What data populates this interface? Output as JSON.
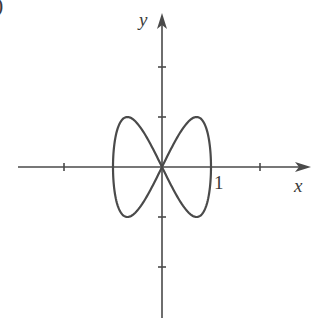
{
  "figure": {
    "panel_label_fragment": ")",
    "x_axis_label": "x",
    "y_axis_label": "y",
    "unit_tick_label": "1"
  },
  "colors": {
    "ink": "#4a4a4a",
    "background": "#ffffff"
  },
  "chart_data": {
    "type": "line",
    "title": "",
    "xlabel": "x",
    "ylabel": "y",
    "parametric": {
      "x": "cos(t)",
      "y": "sin(2t)",
      "t_range": [
        0,
        6.2832
      ]
    },
    "xlim": [
      -3,
      3
    ],
    "ylim": [
      -3,
      3
    ],
    "x_ticks": [
      -2,
      -1,
      1,
      2
    ],
    "y_ticks": [
      -2,
      -1,
      1,
      2
    ],
    "labeled_ticks": [
      {
        "axis": "x",
        "value": 1,
        "label": "1"
      }
    ],
    "grid": false,
    "legend": null,
    "series": [
      {
        "name": "curve",
        "points": [
          [
            1,
            0
          ],
          [
            0.924,
            0.707
          ],
          [
            0.707,
            1
          ],
          [
            0.383,
            0.707
          ],
          [
            0,
            0
          ],
          [
            -0.383,
            -0.707
          ],
          [
            -0.707,
            -1
          ],
          [
            -0.924,
            -0.707
          ],
          [
            -1,
            0
          ],
          [
            -0.924,
            0.707
          ],
          [
            -0.707,
            1
          ],
          [
            -0.383,
            0.707
          ],
          [
            0,
            0
          ],
          [
            0.383,
            -0.707
          ],
          [
            0.707,
            -1
          ],
          [
            0.924,
            -0.707
          ],
          [
            1,
            0
          ]
        ]
      }
    ]
  },
  "layout": {
    "origin_px": [
      162,
      167
    ],
    "unit_px_x": 49,
    "unit_px_y": 50,
    "x_axis_px": [
      18,
      311
    ],
    "y_axis_px": [
      13,
      318
    ]
  }
}
